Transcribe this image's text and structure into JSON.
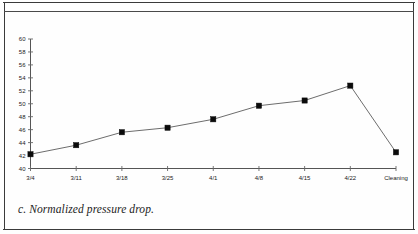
{
  "figure": {
    "caption": "c. Normalized pressure drop."
  },
  "chart_data": {
    "type": "line",
    "title": "",
    "xlabel": "",
    "ylabel": "",
    "categories": [
      "3/4",
      "3/11",
      "3/18",
      "3/25",
      "4/1",
      "4/8",
      "4/15",
      "4/22",
      "Cleaning"
    ],
    "values": [
      42.2,
      43.6,
      45.6,
      46.3,
      47.6,
      49.7,
      50.5,
      52.8,
      42.5
    ],
    "ylim": [
      40,
      60
    ],
    "yticks": [
      40,
      42,
      44,
      46,
      48,
      50,
      52,
      54,
      56,
      58,
      60
    ],
    "ytick_labels": [
      "40",
      "42",
      "44",
      "46",
      "48",
      "50",
      "52",
      "54",
      "56",
      "58",
      "60"
    ],
    "grid": false,
    "legend": "none",
    "marker": "square",
    "marker_color": "#0b0b0b",
    "line_color": "#6d6d6d"
  }
}
